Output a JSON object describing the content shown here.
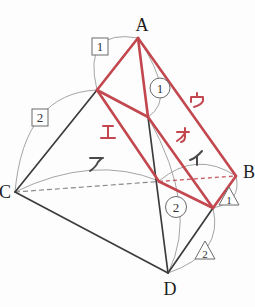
{
  "figure": {
    "vertices": {
      "a": "A",
      "b": "B",
      "c": "C",
      "d": "D"
    },
    "segment_labels": {
      "a": "ア",
      "i": "イ",
      "u": "ウ",
      "e": "エ",
      "o": "オ"
    },
    "badges": {
      "square_1": "1",
      "square_2": "2",
      "circle_1": "1",
      "circle_2": "2",
      "triangle_1": "1",
      "triangle_2": "2"
    },
    "colors": {
      "highlight": "#c2474f",
      "edge": "#3c3c3c",
      "arc": "#9a9a9a",
      "kana": "#4a4a4a"
    }
  }
}
